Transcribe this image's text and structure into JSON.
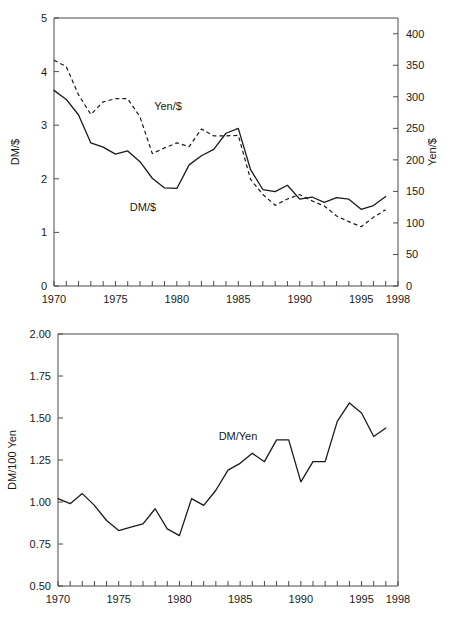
{
  "chart_data": [
    {
      "id": "top",
      "type": "line",
      "title": "",
      "xlabel": "",
      "ylabel": "DM/$",
      "y2label": "Yen/$",
      "xlim": [
        1970,
        1998
      ],
      "ylim": [
        0,
        5
      ],
      "y2lim": [
        0,
        425
      ],
      "grid": false,
      "legend_position": "inline-annotations",
      "x_ticks_labeled": [
        "1970",
        "1975",
        "1980",
        "1985",
        "1990",
        "1995",
        "1998"
      ],
      "x_tick_values_labeled": [
        1970,
        1975,
        1980,
        1985,
        1990,
        1995,
        1998
      ],
      "x_ticks_all": [
        1970,
        1971,
        1972,
        1973,
        1974,
        1975,
        1976,
        1977,
        1978,
        1979,
        1980,
        1981,
        1982,
        1983,
        1984,
        1985,
        1986,
        1987,
        1988,
        1989,
        1990,
        1991,
        1992,
        1993,
        1994,
        1995,
        1996,
        1997,
        1998
      ],
      "y_ticks_left": [
        0,
        1,
        2,
        3,
        4,
        5
      ],
      "y_tick_labels_left": [
        "0",
        "1",
        "2",
        "3",
        "4",
        "5"
      ],
      "y_ticks_right": [
        0,
        50,
        100,
        150,
        200,
        250,
        300,
        350,
        400
      ],
      "y_tick_labels_right": [
        "0",
        "50",
        "100",
        "150",
        "200",
        "250",
        "300",
        "350",
        "400"
      ],
      "x": [
        1970,
        1971,
        1972,
        1973,
        1974,
        1975,
        1976,
        1977,
        1978,
        1979,
        1980,
        1981,
        1982,
        1983,
        1984,
        1985,
        1986,
        1987,
        1988,
        1989,
        1990,
        1991,
        1992,
        1993,
        1994,
        1995,
        1996,
        1997
      ],
      "series": [
        {
          "name": "DM/$",
          "axis": "left",
          "style": "solid",
          "label_text": "DM/$",
          "values": [
            3.65,
            3.48,
            3.19,
            2.67,
            2.59,
            2.46,
            2.52,
            2.32,
            2.01,
            1.83,
            1.82,
            2.26,
            2.43,
            2.55,
            2.85,
            2.94,
            2.17,
            1.8,
            1.76,
            1.88,
            1.62,
            1.66,
            1.56,
            1.65,
            1.62,
            1.43,
            1.5,
            1.67
          ]
        },
        {
          "name": "Yen/$",
          "axis": "right",
          "style": "dashed",
          "label_text": "Yen/$",
          "values": [
            358,
            348,
            303,
            272,
            292,
            297,
            297,
            268,
            210,
            219,
            227,
            221,
            249,
            238,
            238,
            239,
            169,
            145,
            128,
            138,
            145,
            135,
            127,
            111,
            102,
            94,
            109,
            121
          ]
        }
      ]
    },
    {
      "id": "bottom",
      "type": "line",
      "title": "",
      "xlabel": "",
      "ylabel": "DM/100 Yen",
      "xlim": [
        1970,
        1998
      ],
      "ylim": [
        0.5,
        2.0
      ],
      "grid": false,
      "legend_position": "inline-annotation",
      "x_ticks_labeled": [
        "1970",
        "1975",
        "1980",
        "1985",
        "1990",
        "1995",
        "1998"
      ],
      "x_tick_values_labeled": [
        1970,
        1975,
        1980,
        1985,
        1990,
        1995,
        1998
      ],
      "x_ticks_all": [
        1970,
        1971,
        1972,
        1973,
        1974,
        1975,
        1976,
        1977,
        1978,
        1979,
        1980,
        1981,
        1982,
        1983,
        1984,
        1985,
        1986,
        1987,
        1988,
        1989,
        1990,
        1991,
        1992,
        1993,
        1994,
        1995,
        1996,
        1997,
        1998
      ],
      "y_ticks": [
        0.5,
        0.75,
        1.0,
        1.25,
        1.5,
        1.75,
        2.0
      ],
      "y_tick_labels": [
        "0.50",
        "0.75",
        "1.00",
        "1.25",
        "1.50",
        "1.75",
        "2.00"
      ],
      "x": [
        1970,
        1971,
        1972,
        1973,
        1974,
        1975,
        1976,
        1977,
        1978,
        1979,
        1980,
        1981,
        1982,
        1983,
        1984,
        1985,
        1986,
        1987,
        1988,
        1989,
        1990,
        1991,
        1992,
        1993,
        1994,
        1995,
        1996,
        1997
      ],
      "series": [
        {
          "name": "DM/Yen",
          "axis": "left",
          "style": "solid",
          "label_text": "DM/Yen",
          "values": [
            1.02,
            0.99,
            1.05,
            0.98,
            0.89,
            0.83,
            0.85,
            0.87,
            0.96,
            0.84,
            0.8,
            1.02,
            0.98,
            1.07,
            1.19,
            1.23,
            1.29,
            1.24,
            1.37,
            1.37,
            1.12,
            1.24,
            1.24,
            1.48,
            1.59,
            1.53,
            1.39,
            1.44
          ]
        }
      ]
    }
  ]
}
